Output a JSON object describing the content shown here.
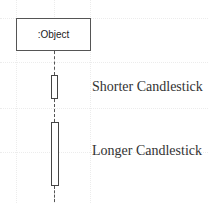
{
  "diagram": {
    "type": "sequence-lifeline",
    "object": {
      "label": ":Object"
    },
    "activations": [
      {
        "name": "short",
        "label": "Shorter Candlestick"
      },
      {
        "name": "long",
        "label": "Longer Candlestick"
      }
    ]
  },
  "colors": {
    "line": "#555555",
    "text": "#333333",
    "grid": "#ececec"
  }
}
